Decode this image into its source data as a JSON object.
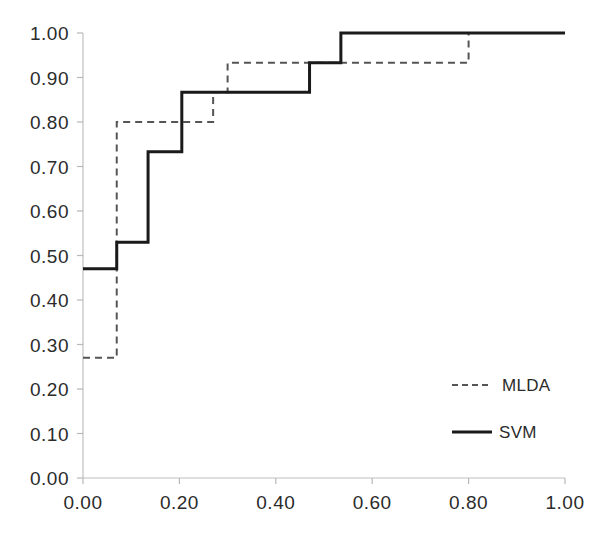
{
  "chart_data": {
    "type": "line",
    "title": "",
    "subtitle": "",
    "xlabel": "",
    "ylabel": "",
    "xlim": [
      0.0,
      1.0
    ],
    "ylim": [
      0.0,
      1.0
    ],
    "grid": false,
    "legend_position": "bottom-right",
    "step_plot": true,
    "step_mode": "post",
    "x_ticks": [
      "0.00",
      "0.20",
      "0.40",
      "0.60",
      "0.80",
      "1.00"
    ],
    "x_tick_values": [
      0.0,
      0.2,
      0.4,
      0.6,
      0.8,
      1.0
    ],
    "y_ticks": [
      "0.00",
      "0.10",
      "0.20",
      "0.30",
      "0.40",
      "0.50",
      "0.60",
      "0.70",
      "0.80",
      "0.90",
      "1.00"
    ],
    "y_tick_values": [
      0.0,
      0.1,
      0.2,
      0.3,
      0.4,
      0.5,
      0.6,
      0.7,
      0.8,
      0.9,
      1.0
    ],
    "series": [
      {
        "name": "MLDA",
        "style": "dashed",
        "color": "#555555",
        "x": [
          0.0,
          0.07,
          0.07,
          0.135,
          0.27,
          0.3,
          0.47,
          0.8,
          1.0
        ],
        "y": [
          0.27,
          0.27,
          0.8,
          0.8,
          0.867,
          0.933,
          0.933,
          1.0,
          1.0
        ]
      },
      {
        "name": "SVM",
        "style": "solid",
        "color": "#1a1a1a",
        "x": [
          0.0,
          0.07,
          0.135,
          0.205,
          0.41,
          0.47,
          0.535,
          1.0
        ],
        "y": [
          0.47,
          0.53,
          0.733,
          0.867,
          0.867,
          0.933,
          1.0,
          1.0
        ]
      }
    ]
  },
  "legend": {
    "items": [
      {
        "label": "MLDA",
        "style": "dashed"
      },
      {
        "label": "SVM",
        "style": "solid"
      }
    ]
  },
  "axes": {
    "x_tick_labels": [
      "0.00",
      "0.20",
      "0.40",
      "0.60",
      "0.80",
      "1.00"
    ],
    "y_tick_labels": [
      "1.00",
      "0.90",
      "0.80",
      "0.70",
      "0.60",
      "0.50",
      "0.40",
      "0.30",
      "0.20",
      "0.10",
      "0.00"
    ]
  },
  "colors": {
    "background": "#ffffff",
    "axis": "#b8b8b8",
    "svm_line": "#1a1a1a",
    "mlda_line": "#555555",
    "text": "#2b2b2b"
  }
}
